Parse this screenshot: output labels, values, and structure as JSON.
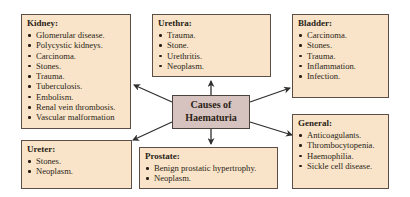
{
  "center": {
    "line1": "Causes of",
    "line2": "Haematuria"
  },
  "boxes": {
    "kidney": {
      "title": "Kidney:",
      "items": [
        "Glomerular disease.",
        "Polycystic kidneys.",
        "Carcinoma.",
        "Stones.",
        "Trauma.",
        "Tuberculosis.",
        "Embolism.",
        "Renal vein thrombosis.",
        "Vascular malformation"
      ]
    },
    "urethra": {
      "title": "Urethra:",
      "items": [
        "Trauma.",
        "Stone.",
        "Urethritis.",
        "Neoplasm."
      ]
    },
    "bladder": {
      "title": "Bladder:",
      "items": [
        "Carcinoma.",
        "Stones.",
        "Trauma.",
        "Inflammation.",
        "Infection."
      ]
    },
    "ureter": {
      "title": "Ureter:",
      "items": [
        "Stones.",
        "Neoplasm."
      ]
    },
    "prostate": {
      "title": "Prostate:",
      "items": [
        "Benign prostatic hypertrophy.",
        "Neoplasm."
      ]
    },
    "general": {
      "title": "General:",
      "items": [
        "Anticoagulants.",
        "Thrombocytopenia.",
        "Haemophilia.",
        "Sickle cell disease."
      ]
    }
  },
  "colors": {
    "box_fill": "#f9e4c9",
    "center_fill": "#d6c2be",
    "border": "#5a4e46",
    "arrow": "#2f2f2f"
  }
}
